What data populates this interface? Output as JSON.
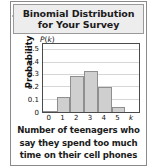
{
  "figure": {
    "title_line1": "Binomial Distribution",
    "title_line2": "for Your Survey",
    "caption_line1": "Number of teenagers who",
    "caption_line2": "say they spend too much",
    "caption_line3": "time on their cell phones",
    "y_axis_label": "Probability",
    "y_axis_symbol_prefix": "P",
    "y_axis_symbol_open": "(",
    "y_axis_symbol_var": "k",
    "y_axis_symbol_close": ")",
    "x_axis_variable": "k",
    "colors": {
      "bar_fill": "#cfcfcf",
      "bar_stroke": "#8f8f8f",
      "frame": "#4a4a4a",
      "gridline": "#d6d6d6",
      "header_band": "#ededed",
      "outer_border": "#8a8a8a",
      "text": "#1b1b1b"
    }
  },
  "chart_data": {
    "type": "bar",
    "title": "Binomial Distribution for Your Survey",
    "subtitle": "",
    "xlabel": "Number of teenagers who say they spend too much time on their cell phones",
    "ylabel": "Probability",
    "x_symbol": "k",
    "y_symbol": "P(k)",
    "categories": [
      "0",
      "1",
      "2",
      "3",
      "4",
      "5"
    ],
    "values": [
      0.01,
      0.125,
      0.29,
      0.33,
      0.2,
      0.04
    ],
    "xtick_labels": [
      "0",
      "1",
      "2",
      "3",
      "4",
      "5",
      "k"
    ],
    "ytick_labels": [
      "0",
      "0.1",
      "0.2",
      "0.3",
      "0.4",
      "0.5"
    ],
    "ytick_values": [
      0,
      0.1,
      0.2,
      0.3,
      0.4,
      0.5
    ],
    "ylim": [
      0,
      0.55
    ],
    "xlim": [
      -0.5,
      6.5
    ],
    "grid": true,
    "grid_axis": "y",
    "legend": false,
    "legend_position": "none"
  }
}
